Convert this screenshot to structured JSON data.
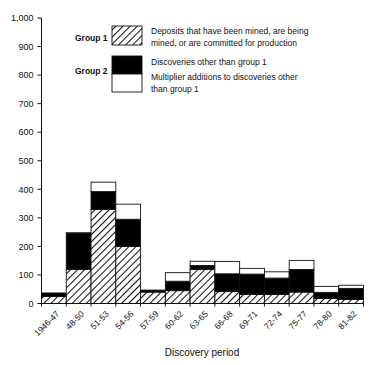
{
  "chart_data": {
    "type": "bar",
    "subtype": "stacked",
    "title": "",
    "xlabel": "Discovery period",
    "ylabel": "",
    "ylim": [
      0,
      1000
    ],
    "ytick_values": [
      0,
      100,
      200,
      300,
      400,
      500,
      600,
      700,
      800,
      900,
      1000
    ],
    "ytick_labels": [
      "0",
      "100",
      "200",
      "300",
      "400",
      "500",
      "600",
      "700",
      "800",
      "900",
      "1,000"
    ],
    "grid": false,
    "legend_position": "upper-center-inside",
    "categories": [
      "1946-47",
      "48-50",
      "51-53",
      "54-56",
      "57-59",
      "60-62",
      "63-65",
      "66-68",
      "69-71",
      "72-74",
      "75-77",
      "78-80",
      "81-82"
    ],
    "series": [
      {
        "name": "Deposits that have been mined, are being mined, or are committed for production",
        "group": "Group 1",
        "pattern": "hatched",
        "values": [
          25,
          120,
          330,
          200,
          40,
          45,
          120,
          42,
          32,
          32,
          40,
          18,
          14
        ]
      },
      {
        "name": "Discoveries other than group 1",
        "group": "Group 2",
        "pattern": "solid-black",
        "values": [
          12,
          125,
          62,
          95,
          5,
          33,
          13,
          62,
          71,
          57,
          79,
          21,
          39
        ]
      },
      {
        "name": "Multiplier additions to discoveries other than group 1",
        "group": "Group 2",
        "pattern": "white",
        "values": [
          0,
          3,
          33,
          53,
          2,
          30,
          15,
          43,
          20,
          22,
          32,
          21,
          11
        ]
      }
    ],
    "totals": [
      37,
      248,
      425,
      348,
      47,
      108,
      148,
      147,
      123,
      111,
      151,
      60,
      64
    ]
  },
  "legend": {
    "group1_label": "Group 1",
    "group2_label": "Group 2",
    "entries": [
      {
        "swatch": "hatched-swatch",
        "line1": "Deposits that have been mined, are being",
        "line2": "mined, or are committed for production"
      },
      {
        "swatch": "black-swatch",
        "line1": "Discoveries other than group 1",
        "line2": ""
      },
      {
        "swatch": "white-swatch",
        "line1": "Multiplier additions to discoveries other",
        "line2": "than group 1"
      }
    ]
  },
  "colors": {
    "axis": "#111111",
    "black_fill": "#000000",
    "white_fill": "#ffffff",
    "hatch_stroke": "#111111",
    "background": "#ffffff"
  }
}
